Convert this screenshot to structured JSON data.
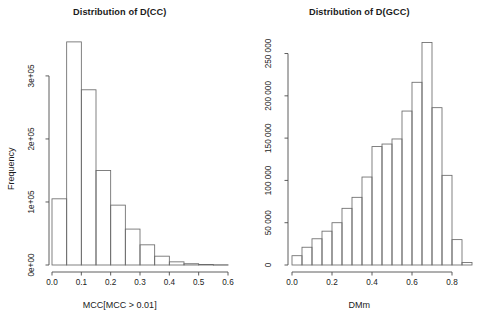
{
  "figure": {
    "background": "#ffffff",
    "foreground": "#1b1b1b",
    "bar_stroke": "#6b6b6b",
    "panels": [
      "left",
      "right"
    ]
  },
  "left_panel": {
    "title": "Distribution of D(CC)",
    "xlabel": "MCC[MCC > 0.01]",
    "ylabel": "Frequency",
    "xticks": [
      "0.0",
      "0.1",
      "0.2",
      "0.3",
      "0.4",
      "0.5",
      "0.6"
    ],
    "yticks": [
      "0e+00",
      "1e+05",
      "2e+05",
      "3e+05"
    ]
  },
  "right_panel": {
    "title": "Distribution of D(GCC)",
    "xlabel": "DMm",
    "ylabel": "Frequency",
    "xticks": [
      "0.0",
      "0.2",
      "0.4",
      "0.6",
      "0.8"
    ],
    "yticks": [
      "0",
      "50 000",
      "100 000",
      "150 000",
      "200 000",
      "250 000"
    ]
  },
  "chart_data": [
    {
      "type": "bar",
      "panel": "left",
      "title": "Distribution of D(CC)",
      "xlabel": "MCC[MCC > 0.01]",
      "ylabel": "Frequency",
      "xlim": [
        0.0,
        0.6
      ],
      "ylim": [
        0,
        354000
      ],
      "bin_width": 0.05,
      "grid": false,
      "legend": "none",
      "bin_edges": [
        0.0,
        0.05,
        0.1,
        0.15,
        0.2,
        0.25,
        0.3,
        0.35,
        0.4,
        0.45,
        0.5,
        0.55,
        0.6
      ],
      "categories": [
        "0.00-0.05",
        "0.05-0.10",
        "0.10-0.15",
        "0.15-0.20",
        "0.20-0.25",
        "0.25-0.30",
        "0.30-0.35",
        "0.35-0.40",
        "0.40-0.45",
        "0.45-0.50",
        "0.50-0.55",
        "0.55-0.60"
      ],
      "values": [
        105000,
        354000,
        278000,
        150000,
        95000,
        57000,
        32000,
        14000,
        5000,
        2000,
        900,
        400
      ],
      "yticks": [
        0,
        100000,
        200000,
        300000
      ],
      "ytick_labels": [
        "0e+00",
        "1e+05",
        "2e+05",
        "3e+05"
      ],
      "xticks": [
        0.0,
        0.1,
        0.2,
        0.3,
        0.4,
        0.5,
        0.6
      ],
      "xtick_labels": [
        "0.0",
        "0.1",
        "0.2",
        "0.3",
        "0.4",
        "0.5",
        "0.6"
      ]
    },
    {
      "type": "bar",
      "panel": "right",
      "title": "Distribution of D(GCC)",
      "xlabel": "DMm",
      "ylabel": "Frequency",
      "xlim": [
        0.0,
        0.9
      ],
      "ylim": [
        0,
        263000
      ],
      "bin_width": 0.05,
      "grid": false,
      "legend": "none",
      "bin_edges": [
        0.0,
        0.05,
        0.1,
        0.15,
        0.2,
        0.25,
        0.3,
        0.35,
        0.4,
        0.45,
        0.5,
        0.55,
        0.6,
        0.65,
        0.7,
        0.75,
        0.8,
        0.85,
        0.9
      ],
      "categories": [
        "0.00-0.05",
        "0.05-0.10",
        "0.10-0.15",
        "0.15-0.20",
        "0.20-0.25",
        "0.25-0.30",
        "0.30-0.35",
        "0.35-0.40",
        "0.40-0.45",
        "0.45-0.50",
        "0.50-0.55",
        "0.55-0.60",
        "0.60-0.65",
        "0.65-0.70",
        "0.70-0.75",
        "0.75-0.80",
        "0.80-0.85",
        "0.85-0.90"
      ],
      "values": [
        11000,
        21000,
        31000,
        40000,
        50000,
        67000,
        80000,
        104000,
        140000,
        143000,
        149000,
        182000,
        216000,
        263000,
        186000,
        106000,
        30000,
        3000
      ],
      "yticks": [
        0,
        50000,
        100000,
        150000,
        200000,
        250000
      ],
      "ytick_labels": [
        "0",
        "50 000",
        "100 000",
        "150 000",
        "200 000",
        "250 000"
      ],
      "xticks": [
        0.0,
        0.2,
        0.4,
        0.6,
        0.8
      ],
      "xtick_labels": [
        "0.0",
        "0.2",
        "0.4",
        "0.6",
        "0.8"
      ]
    }
  ]
}
